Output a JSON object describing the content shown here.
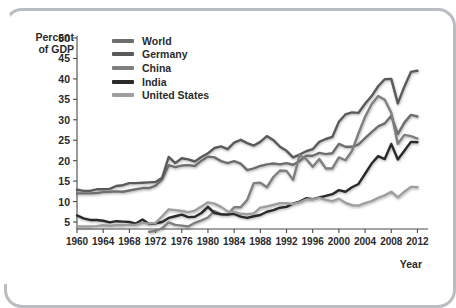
{
  "axis": {
    "ylabel_line1": "Percent",
    "ylabel_line2": "of GDP",
    "xlabel": "Year"
  },
  "chart_data": {
    "type": "line",
    "title": "",
    "xlabel": "Year",
    "ylabel": "Percent of GDP",
    "xlim": [
      1960,
      2013
    ],
    "ylim": [
      2,
      50
    ],
    "ytick_labels": [
      "50",
      "45",
      "40",
      "35",
      "30",
      "25",
      "20",
      "15",
      "10",
      "5"
    ],
    "ytick_values": [
      50,
      45,
      40,
      35,
      30,
      25,
      20,
      15,
      10,
      5
    ],
    "xtick_labels": [
      "1960",
      "1964",
      "1968",
      "1972",
      "1976",
      "1980",
      "1984",
      "1988",
      "1992",
      "1996",
      "2000",
      "2004",
      "2008",
      "2012"
    ],
    "xtick_values": [
      1960,
      1964,
      1968,
      1972,
      1976,
      1980,
      1984,
      1988,
      1992,
      1996,
      2000,
      2004,
      2008,
      2012
    ],
    "grid": false,
    "legend_position": "upper-left",
    "series": [
      {
        "name": "World",
        "color": "#6e6e6e",
        "width": 2.4,
        "x": [
          1960,
          1961,
          1962,
          1963,
          1964,
          1965,
          1966,
          1967,
          1968,
          1969,
          1970,
          1971,
          1972,
          1973,
          1974,
          1975,
          1976,
          1977,
          1978,
          1979,
          1980,
          1981,
          1982,
          1983,
          1984,
          1985,
          1986,
          1987,
          1988,
          1989,
          1990,
          1991,
          1992,
          1993,
          1994,
          1995,
          1996,
          1997,
          1998,
          1999,
          2000,
          2001,
          2002,
          2003,
          2004,
          2005,
          2006,
          2007,
          2008,
          2009,
          2010,
          2011,
          2012
        ],
        "y": [
          12.0,
          12.0,
          12.0,
          12.1,
          12.3,
          12.4,
          12.5,
          12.4,
          12.7,
          13.0,
          13.3,
          13.3,
          13.9,
          15.4,
          18.9,
          18.4,
          18.8,
          18.9,
          18.7,
          20.0,
          21.0,
          20.8,
          19.9,
          19.4,
          19.9,
          19.3,
          17.7,
          18.1,
          18.7,
          19.1,
          19.3,
          19.1,
          19.4,
          19.0,
          19.9,
          21.2,
          21.2,
          21.9,
          21.6,
          21.8,
          24.1,
          23.4,
          23.4,
          24.0,
          25.5,
          27.0,
          28.4,
          29.1,
          31.0,
          26.5,
          29.3,
          31.2,
          30.8
        ]
      },
      {
        "name": "Germany",
        "color": "#5a5a5a",
        "width": 2.4,
        "x": [
          1960,
          1961,
          1962,
          1963,
          1964,
          1965,
          1966,
          1967,
          1968,
          1969,
          1970,
          1971,
          1972,
          1973,
          1974,
          1975,
          1976,
          1977,
          1978,
          1979,
          1980,
          1981,
          1982,
          1983,
          1984,
          1985,
          1986,
          1987,
          1988,
          1989,
          1990,
          1991,
          1992,
          1993,
          1994,
          1995,
          1996,
          1997,
          1998,
          1999,
          2000,
          2001,
          2002,
          2003,
          2004,
          2005,
          2006,
          2007,
          2008,
          2009,
          2010,
          2011,
          2012
        ],
        "y": [
          12.9,
          12.6,
          12.6,
          13.0,
          13.0,
          13.1,
          13.8,
          14.0,
          14.5,
          14.5,
          14.6,
          14.7,
          14.8,
          15.8,
          20.9,
          19.4,
          20.6,
          20.3,
          19.8,
          20.9,
          21.8,
          23.1,
          23.5,
          22.8,
          24.4,
          25.1,
          24.3,
          23.7,
          24.6,
          26.0,
          25.0,
          23.4,
          22.4,
          20.8,
          21.5,
          22.3,
          22.8,
          24.6,
          25.3,
          25.8,
          29.5,
          31.3,
          31.8,
          31.7,
          33.9,
          35.8,
          38.2,
          39.9,
          40.0,
          34.0,
          38.1,
          41.7,
          42.0
        ]
      },
      {
        "name": "China",
        "color": "#7f7f7f",
        "width": 2.4,
        "x": [
          1971,
          1972,
          1973,
          1974,
          1975,
          1976,
          1977,
          1978,
          1979,
          1980,
          1981,
          1982,
          1983,
          1984,
          1985,
          1986,
          1987,
          1988,
          1989,
          1990,
          1991,
          1992,
          1993,
          1994,
          1995,
          1996,
          1997,
          1998,
          1999,
          2000,
          2001,
          2002,
          2003,
          2004,
          2005,
          2006,
          2007,
          2008,
          2009,
          2010,
          2011,
          2012
        ],
        "y": [
          2.6,
          2.8,
          3.5,
          4.9,
          4.3,
          4.1,
          3.9,
          4.8,
          5.4,
          6.1,
          7.7,
          6.9,
          6.8,
          8.6,
          8.6,
          10.4,
          14.5,
          14.6,
          13.5,
          16.0,
          17.6,
          17.5,
          15.3,
          21.3,
          20.4,
          18.5,
          20.4,
          18.1,
          18.1,
          20.8,
          20.1,
          22.4,
          26.7,
          30.7,
          33.8,
          35.8,
          34.9,
          31.7,
          24.1,
          26.3,
          26.0,
          25.4
        ]
      },
      {
        "name": "India",
        "color": "#2a2a2a",
        "width": 2.4,
        "x": [
          1960,
          1961,
          1962,
          1963,
          1964,
          1965,
          1966,
          1967,
          1968,
          1969,
          1970,
          1971,
          1972,
          1973,
          1974,
          1975,
          1976,
          1977,
          1978,
          1979,
          1980,
          1981,
          1982,
          1983,
          1984,
          1985,
          1986,
          1987,
          1988,
          1989,
          1990,
          1991,
          1992,
          1993,
          1994,
          1995,
          1996,
          1997,
          1998,
          1999,
          2000,
          2001,
          2002,
          2003,
          2004,
          2005,
          2006,
          2007,
          2008,
          2009,
          2010,
          2011,
          2012
        ],
        "y": [
          6.6,
          5.9,
          5.5,
          5.5,
          5.3,
          4.9,
          5.2,
          5.1,
          5.0,
          4.6,
          5.6,
          4.5,
          4.7,
          5.0,
          6.0,
          6.4,
          6.8,
          6.2,
          6.3,
          7.2,
          8.7,
          7.2,
          6.9,
          6.8,
          7.0,
          6.3,
          6.0,
          6.4,
          6.7,
          7.5,
          7.9,
          8.5,
          8.7,
          9.5,
          10.0,
          10.8,
          10.6,
          11.0,
          11.4,
          11.8,
          12.8,
          12.4,
          13.5,
          14.3,
          16.8,
          19.3,
          21.1,
          20.4,
          24.1,
          20.3,
          22.4,
          24.6,
          24.5
        ]
      },
      {
        "name": "United States",
        "color": "#9e9e9e",
        "width": 2.4,
        "x": [
          1960,
          1961,
          1962,
          1963,
          1964,
          1965,
          1966,
          1967,
          1968,
          1969,
          1970,
          1971,
          1972,
          1973,
          1974,
          1975,
          1976,
          1977,
          1978,
          1979,
          1980,
          1981,
          1982,
          1983,
          1984,
          1985,
          1986,
          1987,
          1988,
          1989,
          1990,
          1991,
          1992,
          1993,
          1994,
          1995,
          1996,
          1997,
          1998,
          1999,
          2000,
          2001,
          2002,
          2003,
          2004,
          2005,
          2006,
          2007,
          2008,
          2009,
          2010,
          2011,
          2012
        ],
        "y": [
          3.9,
          3.9,
          3.9,
          4.0,
          4.2,
          4.1,
          4.2,
          4.2,
          4.3,
          4.3,
          4.8,
          4.6,
          4.8,
          6.4,
          8.1,
          7.9,
          7.7,
          7.4,
          7.8,
          8.8,
          9.8,
          9.5,
          8.7,
          7.6,
          7.5,
          7.0,
          6.9,
          7.1,
          8.5,
          8.8,
          9.2,
          9.6,
          9.6,
          9.4,
          9.8,
          10.5,
          10.5,
          10.9,
          10.4,
          10.1,
          10.7,
          9.7,
          9.1,
          9.0,
          9.6,
          10.1,
          10.9,
          11.5,
          12.4,
          11.0,
          12.4,
          13.6,
          13.5
        ]
      }
    ]
  }
}
